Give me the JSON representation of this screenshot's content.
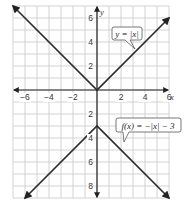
{
  "chart_data": {
    "type": "line",
    "title": "",
    "xlabel": "x",
    "ylabel": "y",
    "xlim": [
      -7,
      6
    ],
    "ylim": [
      -9,
      7
    ],
    "grid": true,
    "x_ticks": [
      -6,
      -4,
      -2,
      2,
      4,
      6
    ],
    "x_tick_labels": [
      "−6",
      "−4",
      "−2",
      "2",
      "4",
      "6"
    ],
    "y_ticks": [
      6,
      4,
      2,
      -2,
      -4,
      -6,
      -8
    ],
    "y_tick_labels": [
      "6",
      "4",
      "2",
      "2",
      "4",
      "6",
      "8"
    ],
    "series": [
      {
        "name": "y = |x|",
        "label": "y = |x|",
        "points": [
          [
            -7,
            7
          ],
          [
            0,
            0
          ],
          [
            6,
            6
          ]
        ],
        "arrows": "both"
      },
      {
        "name": "f(x) = −|x| − 3",
        "label": "f(x) = −|x| − 3",
        "points": [
          [
            -6,
            -9
          ],
          [
            0,
            -3
          ],
          [
            6,
            -9
          ]
        ],
        "arrows": "both"
      }
    ],
    "annotations": [
      {
        "text": "y = |x|",
        "points_to": [
          4,
          4
        ]
      },
      {
        "text": "f(x) = −|x| − 3",
        "points_to": [
          2,
          -5
        ]
      }
    ]
  },
  "labels": {
    "x_axis": "x",
    "y_axis": "y",
    "callout_1": "y = |x|",
    "callout_2": "f(x) = −|x| − 3"
  }
}
